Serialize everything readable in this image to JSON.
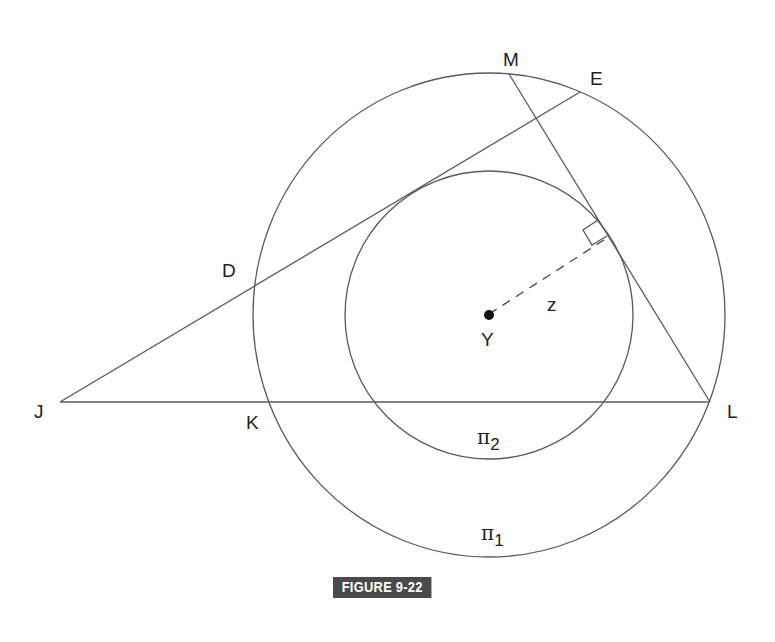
{
  "figure": {
    "caption": "FIGURE 9-22"
  },
  "points": {
    "M": "M",
    "E": "E",
    "D": "D",
    "J": "J",
    "K": "K",
    "L": "L",
    "Y": "Y",
    "z": "z"
  },
  "circles": {
    "outer": {
      "label": "π",
      "subscript": "1"
    },
    "inner": {
      "label": "π",
      "subscript": "2"
    }
  },
  "colors": {
    "line": "#5a5a5a",
    "text": "#222222",
    "badge_bg": "#4a4a4a",
    "badge_text": "#ffffff"
  }
}
